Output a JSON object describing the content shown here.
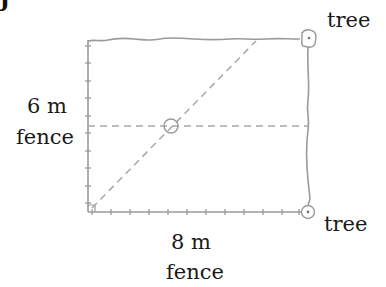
{
  "figure": {
    "corner_glyph": "J",
    "labels": {
      "left_measure": "6 m",
      "left_caption": "fence",
      "bottom_measure": "8 m",
      "bottom_caption": "fence",
      "tree_top": "tree",
      "tree_bottom": "tree"
    },
    "dimensions": {
      "width_m": 8,
      "height_m": 6
    },
    "colors": {
      "line": "#9a9a9a",
      "dashed": "#a8a8a8",
      "text": "#1a1a1a"
    },
    "icons": {
      "tree_top": "tree-marker-icon",
      "tree_bottom": "tree-marker-icon",
      "center_point": "circle-marker-icon"
    }
  }
}
